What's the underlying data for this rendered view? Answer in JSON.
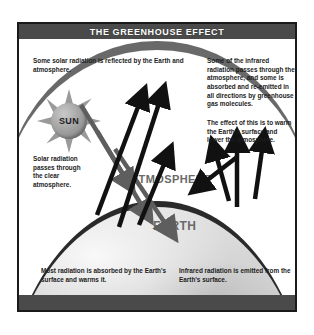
{
  "poster": {
    "title": "THE GREENHOUSE EFFECT",
    "banner_color": "#4a4a4a",
    "banner_text_color": "#ffffff",
    "border_color": "#1a1a1a",
    "background_color": "#ffffff"
  },
  "sun": {
    "label": "SUN",
    "icon": "sun-icon",
    "body_color": "#9f9f9f",
    "ray_color": "#9a9a9a"
  },
  "layers": {
    "atmosphere_label": "ATMOSPHERE",
    "earth_label": "EARTH",
    "label_color": "#6a6a6a",
    "earth_surface_color": "#d2d2d2",
    "atmosphere_band_color": "#5d5d5d",
    "earth_outline_color": "#2a2a2a"
  },
  "annotations": {
    "reflected": "Some solar radiation is reflected by the Earth and atmosphere.",
    "infrared_absorbed": "Some of the infrared radiation passes through the atmosphere, and some is absorbed and re-emitted in all directions by greenhouse gas molecules.",
    "warming_effect": "The effect of this is to warm the Earth's surface and lower the atmosphere.",
    "solar_passes": "Solar radiation passes through the clear atmosphere.",
    "absorbed_surface": "Most radiation is absorbed by the Earth's surface and warms it.",
    "infrared_emitted": "Infrared radiation is emitted from the Earth's surface."
  },
  "arrows": {
    "incoming_solar_color": "#5e5e5e",
    "reflected_color": "#111111",
    "infrared_color": "#111111",
    "incoming_count": 3,
    "reflected_count": 2,
    "infrared_up_count": 3,
    "reemitted_count": 1
  }
}
